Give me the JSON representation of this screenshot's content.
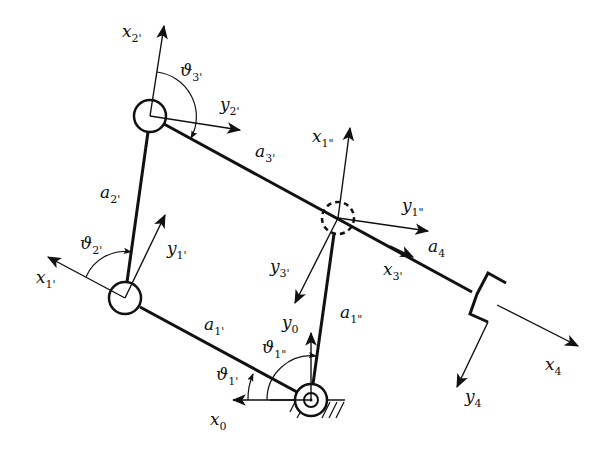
{
  "diagram": {
    "title": "",
    "colors": {
      "stroke": "#111111",
      "background": "#ffffff"
    },
    "labels": {
      "x2p": {
        "base": "x",
        "sub": "2'"
      },
      "v3p": {
        "base": "ϑ",
        "sub": "3'"
      },
      "y2p": {
        "base": "y",
        "sub": "2'"
      },
      "a3p": {
        "base": "a",
        "sub": "3'"
      },
      "a2p": {
        "base": "a",
        "sub": "2'"
      },
      "x1pp": {
        "base": "x",
        "sub": "1\""
      },
      "y1pp": {
        "base": "y",
        "sub": "1\""
      },
      "v2p": {
        "base": "ϑ",
        "sub": "2'"
      },
      "y1p": {
        "base": "y",
        "sub": "1'"
      },
      "x1p": {
        "base": "x",
        "sub": "1'"
      },
      "y3p": {
        "base": "y",
        "sub": "3'"
      },
      "x3p": {
        "base": "x",
        "sub": "3'"
      },
      "a4": {
        "base": "a",
        "sub": "4"
      },
      "a1p": {
        "base": "a",
        "sub": "1'"
      },
      "y0": {
        "base": "y",
        "sub": "0"
      },
      "a1pp": {
        "base": "a",
        "sub": "1\""
      },
      "v1pp": {
        "base": "ϑ",
        "sub": "1\""
      },
      "v1p": {
        "base": "ϑ",
        "sub": "1'"
      },
      "x0": {
        "base": "x",
        "sub": "0"
      },
      "x4": {
        "base": "x",
        "sub": "4"
      },
      "y4": {
        "base": "y",
        "sub": "4"
      }
    },
    "joints": [
      {
        "name": "base-joint",
        "type": "fixed-revolute"
      },
      {
        "name": "joint-1-prime",
        "type": "revolute"
      },
      {
        "name": "joint-2-prime",
        "type": "revolute"
      },
      {
        "name": "joint-1-double-prime",
        "type": "passive-dashed"
      }
    ],
    "end_effector": "gripper"
  }
}
